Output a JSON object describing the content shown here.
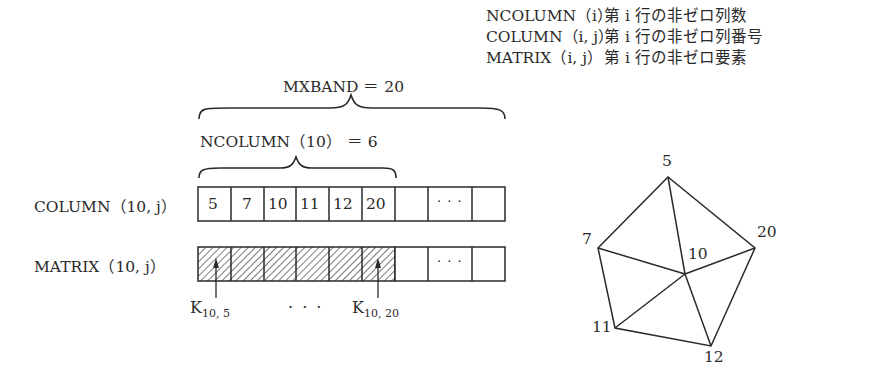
{
  "legend": [
    {
      "key": "NCOLUMN（i）",
      "desc": "第 i 行の非ゼロ列数"
    },
    {
      "key": "COLUMN（i, j）",
      "desc": "第 i 行の非ゼロ列番号"
    },
    {
      "key": "MATRIX（i, j）",
      "desc": "第 i 行の非ゼロ要素"
    }
  ],
  "brace_outer_label": "MXBAND ＝ 20",
  "brace_inner_label": "NCOLUMN（10） ＝ 6",
  "rows": {
    "column_label": "COLUMN（10, j）",
    "matrix_label": "MATRIX（10, j）",
    "column_values": [
      "5",
      "7",
      "10",
      "11",
      "12",
      "20"
    ],
    "ellipsis": "· · ·"
  },
  "annotations": {
    "k_first_main": "K",
    "k_first_sub": "10, 5",
    "k_last_main": "K",
    "k_last_sub": "10, 20",
    "dots": "· · ·"
  },
  "graph": {
    "center": "10",
    "nodes": [
      "5",
      "7",
      "20",
      "11",
      "12"
    ]
  }
}
